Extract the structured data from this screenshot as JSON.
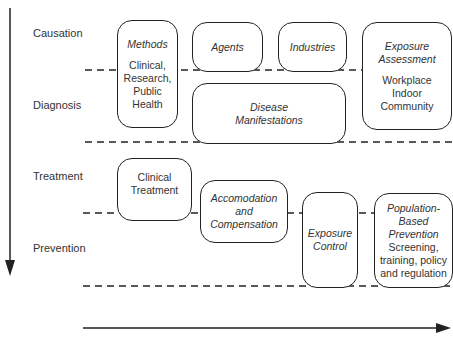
{
  "stages": [
    {
      "label": "Causation"
    },
    {
      "label": "Diagnosis"
    },
    {
      "label": "Treatment"
    },
    {
      "label": "Prevention"
    }
  ],
  "boxes": {
    "methods": {
      "title": "Methods",
      "body": [
        "Clinical,",
        "Research,",
        "Public",
        "Health"
      ]
    },
    "agents": {
      "title": "Agents"
    },
    "industries": {
      "title": "Industries"
    },
    "exposure_assessment": {
      "title": [
        "Exposure",
        "Assessment"
      ],
      "body": [
        "Workplace",
        "Indoor",
        "Community"
      ]
    },
    "disease_manifestations": {
      "title": [
        "Disease",
        "Manifestations"
      ]
    },
    "clinical_treatment": {
      "body": [
        "Clinical",
        "Treatment"
      ]
    },
    "accomodation": {
      "title": [
        "Accomodation",
        "and",
        "Compensation"
      ]
    },
    "exposure_control": {
      "title": [
        "Exposure",
        "Control"
      ]
    },
    "population_prevention": {
      "title": [
        "Population-",
        "Based",
        "Prevention"
      ],
      "body": [
        "Screening,",
        "training, policy",
        "and regulation"
      ]
    }
  },
  "colors": {
    "line": "#222222",
    "text": "#333333",
    "background": "#ffffff"
  }
}
